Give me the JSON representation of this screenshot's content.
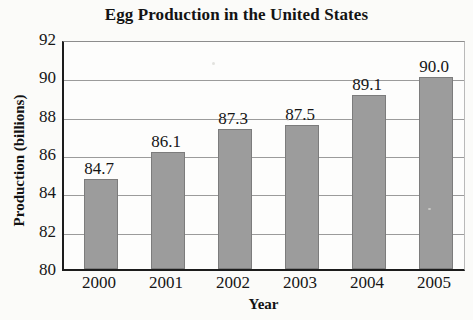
{
  "chart_data": {
    "type": "bar",
    "title": "Egg Production in the United States",
    "xlabel": "Year",
    "ylabel": "Production (billions)",
    "categories": [
      "2000",
      "2001",
      "2002",
      "2003",
      "2004",
      "2005"
    ],
    "values": [
      84.7,
      86.1,
      87.3,
      87.5,
      89.1,
      90.0
    ],
    "value_labels": [
      "84.7",
      "86.1",
      "87.3",
      "87.5",
      "89.1",
      "90.0"
    ],
    "ylim": [
      80,
      92
    ],
    "yticks": [
      80,
      82,
      84,
      86,
      88,
      90,
      92
    ],
    "ytick_labels": [
      "80",
      "82",
      "84",
      "86",
      "88",
      "90",
      "92"
    ],
    "grid": true,
    "grid_axis": "y",
    "legend": null,
    "legend_position": "none",
    "bar_color": "#9c9c9c",
    "bar_edge_color": "#7c7c7c",
    "axis_color": "#1c1c1c",
    "gridline_color": "#9b9b9b",
    "background_color": "#fbfbf9",
    "text_color": "#161616"
  }
}
